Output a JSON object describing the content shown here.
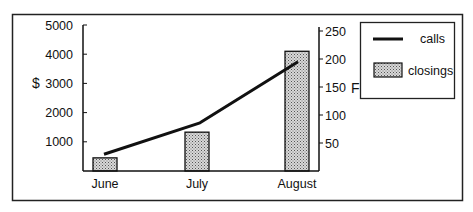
{
  "chart_data": {
    "type": "bar+line",
    "title": "",
    "categories": [
      "June",
      "July",
      "August"
    ],
    "series": [
      {
        "name": "closings",
        "type": "bar",
        "axis": "left",
        "values": [
          450,
          1330,
          4100
        ]
      },
      {
        "name": "calls",
        "type": "line",
        "axis": "right",
        "values": [
          30,
          86,
          195
        ]
      }
    ],
    "left_axis": {
      "label": "$",
      "ylim": [
        0,
        5000
      ],
      "ticks": [
        1000,
        2000,
        3000,
        4000,
        5000
      ]
    },
    "right_axis": {
      "label": "F",
      "ylim": [
        0,
        250
      ],
      "ticks": [
        50,
        100,
        150,
        200,
        250
      ]
    },
    "xlabel": "",
    "grid": false,
    "legend": {
      "position": "right",
      "entries": [
        {
          "label": "calls",
          "style": "line"
        },
        {
          "label": "closings",
          "style": "patterned-bar"
        }
      ]
    }
  },
  "colors": {
    "line": "#111111",
    "bar_fill": "#c9c9c9",
    "bar_stroke": "#111111",
    "frame": "#222222"
  }
}
